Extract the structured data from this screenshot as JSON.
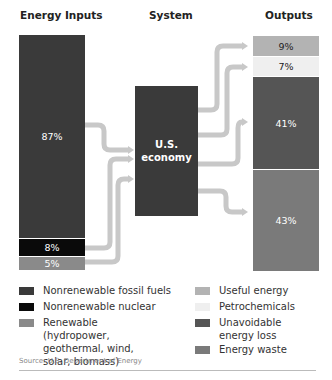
{
  "headers": {
    "inputs": "Energy Inputs",
    "system": "System",
    "outputs": "Outputs"
  },
  "system_box": {
    "line1": "U.S.",
    "line2": "economy"
  },
  "inputs": [
    {
      "name": "Nonrenewable fossil fuels",
      "value": "87%",
      "color": "#3a3a3a"
    },
    {
      "name": "Nonrenewable nuclear",
      "value": "8%",
      "color": "#0a0a0a"
    },
    {
      "name": "Renewable",
      "value": "5%",
      "color": "#8a8a8a"
    }
  ],
  "outputs": [
    {
      "name": "Useful energy",
      "value": "9%",
      "color": "#b3b3b3"
    },
    {
      "name": "Petrochemicals",
      "value": "7%",
      "color": "#efefef"
    },
    {
      "name": "Unavoidable energy loss",
      "value": "41%",
      "color": "#555555"
    },
    {
      "name": "Energy waste",
      "value": "43%",
      "color": "#7a7a7a"
    }
  ],
  "legend": {
    "left": [
      {
        "label": "Nonrenewable fossil fuels",
        "color": "#3a3a3a"
      },
      {
        "label": "Nonrenewable nuclear",
        "color": "#0a0a0a"
      },
      {
        "label": "Renewable (hydropower, geothermal, wind, solar, biomass)",
        "color": "#8a8a8a"
      }
    ],
    "right": [
      {
        "label": "Useful energy",
        "color": "#b3b3b3"
      },
      {
        "label": "Petrochemicals",
        "color": "#efefef"
      },
      {
        "label": "Unavoidable energy loss",
        "color": "#555555"
      },
      {
        "label": "Energy waste",
        "color": "#7a7a7a"
      }
    ]
  },
  "source": "Source: U.S. Department of Energy",
  "flow_color": "#c8c8c8"
}
